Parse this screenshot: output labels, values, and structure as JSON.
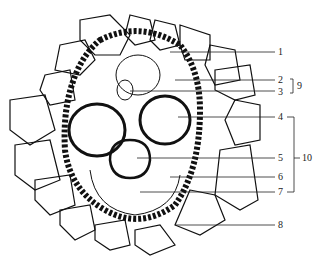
{
  "diagram": {
    "type": "botanical cross-section (vascular bundle)",
    "labels": [
      {
        "id": "1",
        "text": "1",
        "x": 278,
        "y": 48
      },
      {
        "id": "2",
        "text": "2",
        "x": 278,
        "y": 75
      },
      {
        "id": "3",
        "text": "3",
        "x": 278,
        "y": 89
      },
      {
        "id": "4",
        "text": "4",
        "x": 278,
        "y": 113
      },
      {
        "id": "5",
        "text": "5",
        "x": 278,
        "y": 154
      },
      {
        "id": "6",
        "text": "6",
        "x": 278,
        "y": 173
      },
      {
        "id": "7",
        "text": "7",
        "x": 278,
        "y": 188
      },
      {
        "id": "8",
        "text": "8",
        "x": 278,
        "y": 221
      },
      {
        "id": "9",
        "text": "9",
        "x": 297,
        "y": 81
      },
      {
        "id": "10",
        "text": "10",
        "x": 302,
        "y": 154
      }
    ],
    "brackets": [
      {
        "label": "9",
        "from": "2",
        "to": "3"
      },
      {
        "label": "10",
        "from": "4",
        "to": "7"
      }
    ]
  }
}
